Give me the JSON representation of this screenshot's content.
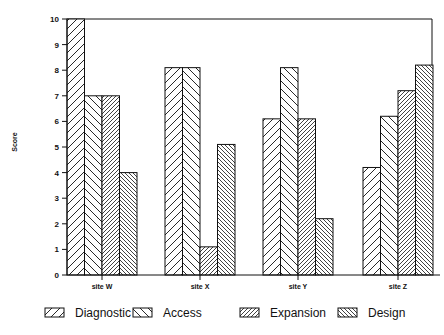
{
  "chart_data": {
    "type": "bar",
    "title": "",
    "xlabel": "",
    "ylabel": "Score",
    "ylim": [
      0,
      10
    ],
    "yticks": [
      0,
      1,
      2,
      3,
      4,
      5,
      6,
      7,
      8,
      9,
      10
    ],
    "grid": false,
    "legend_position": "bottom",
    "categories": [
      "site W",
      "site X",
      "site Y",
      "site Z"
    ],
    "series": [
      {
        "name": "Diagnostic",
        "pattern": "forward-diagonal-wide",
        "values": [
          10,
          8.1,
          6.1,
          4.2
        ]
      },
      {
        "name": "Access",
        "pattern": "back-diagonal-wide",
        "values": [
          7.0,
          8.1,
          8.1,
          6.2
        ]
      },
      {
        "name": "Expansion",
        "pattern": "forward-diagonal-dense",
        "values": [
          7.0,
          1.1,
          6.1,
          7.2
        ]
      },
      {
        "name": "Design",
        "pattern": "back-diagonal-dense",
        "values": [
          4.0,
          5.1,
          2.2,
          8.2
        ]
      }
    ]
  },
  "colors": {
    "ink": "#111111",
    "background": "#ffffff"
  }
}
